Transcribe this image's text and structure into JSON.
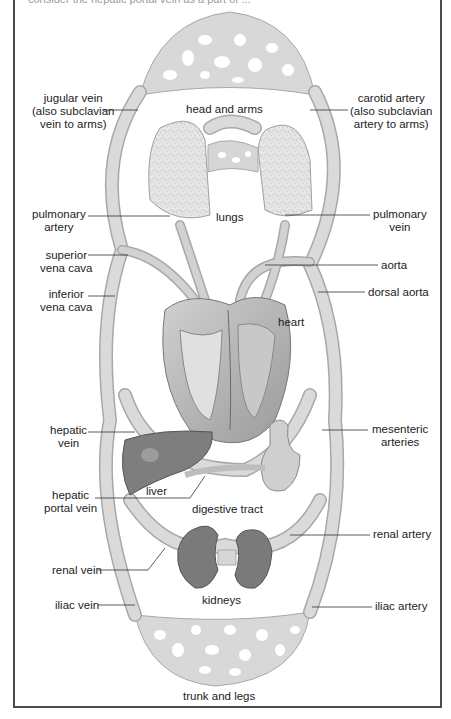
{
  "caption": "consider the hepatic portal vein as a part of ...",
  "diagram": {
    "title_regions": {
      "head_and_arms": "head and arms",
      "lungs": "lungs",
      "heart": "heart",
      "liver": "liver",
      "digestive_tract": "digestive tract",
      "kidneys": "kidneys",
      "trunk_and_legs": "trunk and legs"
    },
    "left_labels": {
      "jugular_vein": [
        "jugular vein",
        "(also subclavian",
        "vein to arms)"
      ],
      "pulmonary_artery": [
        "pulmonary",
        "artery"
      ],
      "superior_vena_cava": [
        "superior",
        "vena cava"
      ],
      "inferior_vena_cava": [
        "inferior",
        "vena cava"
      ],
      "hepatic_vein": [
        "hepatic",
        "vein"
      ],
      "hepatic_portal_vein": [
        "hepatic",
        "portal vein"
      ],
      "renal_vein": "renal vein",
      "iliac_vein": "iliac vein"
    },
    "right_labels": {
      "carotid_artery": [
        "carotid artery",
        "(also subclavian",
        "artery to arms)"
      ],
      "pulmonary_vein": [
        "pulmonary",
        "vein"
      ],
      "aorta": "aorta",
      "dorsal_aorta": "dorsal aorta",
      "mesenteric_arteries": [
        "mesenteric",
        "arteries"
      ],
      "renal_artery": "renal artery",
      "iliac_artery": "iliac artery"
    },
    "colors": {
      "vessel": "#d6d6d6",
      "vessel_edge": "#a8a8a8",
      "organ_dark": "#7a7a7a",
      "lung": "#e4e4e4",
      "heart": "#bdbdbd",
      "border": "#4a4a4a"
    }
  }
}
